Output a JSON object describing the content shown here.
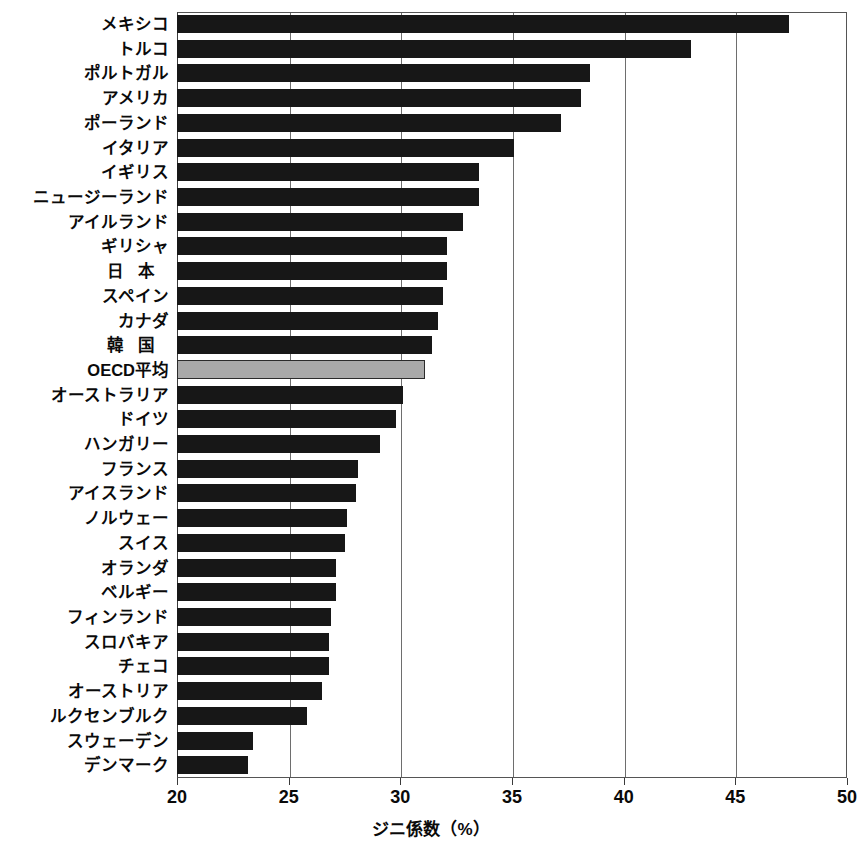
{
  "chart_data": {
    "type": "bar",
    "orientation": "horizontal",
    "title": "",
    "xlabel": "ジニ係数（%）",
    "ylabel": "",
    "xlim": [
      20,
      50
    ],
    "xticks": [
      20,
      25,
      30,
      35,
      40,
      45,
      50
    ],
    "grid": "vertical",
    "legend": "none",
    "highlight_category": "OECD平均",
    "colors": {
      "bar": "#171717",
      "highlight_bar": "#a9a9a9",
      "grid": "#6e6e6e",
      "axis": "#3a3a3a",
      "background": "#ffffff"
    },
    "categories": [
      "メキシコ",
      "トルコ",
      "ポルトガル",
      "アメリカ",
      "ポーランド",
      "イタリア",
      "イギリス",
      "ニュージーランド",
      "アイルランド",
      "ギリシャ",
      "日 本",
      "スペイン",
      "カナダ",
      "韓 国",
      "OECD平均",
      "オーストラリア",
      "ドイツ",
      "ハンガリー",
      "フランス",
      "アイスランド",
      "ノルウェー",
      "スイス",
      "オランダ",
      "ベルギー",
      "フィンランド",
      "スロバキア",
      "チェコ",
      "オーストリア",
      "ルクセンブルク",
      "スウェーデン",
      "デンマーク"
    ],
    "values": [
      47.4,
      43.0,
      38.5,
      38.1,
      37.2,
      35.1,
      33.5,
      33.5,
      32.8,
      32.1,
      32.1,
      31.9,
      31.7,
      31.4,
      31.1,
      30.1,
      29.8,
      29.1,
      28.1,
      28.0,
      27.6,
      27.5,
      27.1,
      27.1,
      26.9,
      26.8,
      26.8,
      26.5,
      25.8,
      23.4,
      23.2
    ]
  },
  "axis": {
    "tick_labels": [
      "20",
      "25",
      "30",
      "35",
      "40",
      "45",
      "50"
    ],
    "title": "ジニ係数（%）"
  }
}
